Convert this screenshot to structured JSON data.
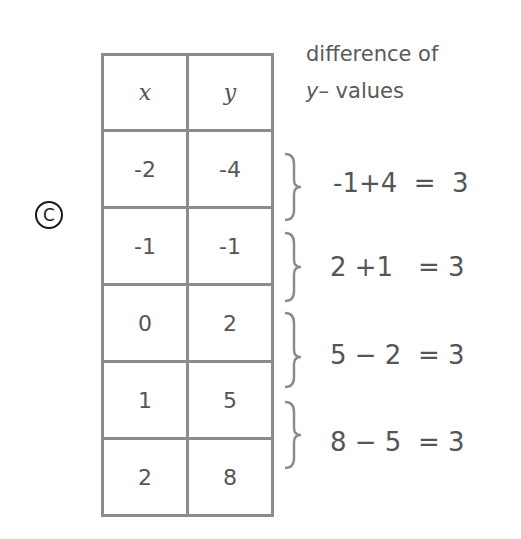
{
  "choice": {
    "label": "C",
    "symbol": "©"
  },
  "table": {
    "headers": {
      "x": "x",
      "y": "y"
    },
    "rows": [
      {
        "x": "-2",
        "y": "-4"
      },
      {
        "x": "-1",
        "y": "-1"
      },
      {
        "x": "0",
        "y": "2"
      },
      {
        "x": "1",
        "y": "5"
      },
      {
        "x": "2",
        "y": "8"
      }
    ]
  },
  "annotation": {
    "line1": "difference of",
    "line2_var": "y",
    "line2_rest": "– values"
  },
  "differences": [
    {
      "expression": "-1 + 4",
      "result": "3",
      "display": "-1+4  =  3"
    },
    {
      "expression": "2 + 1",
      "result": "3",
      "display": "2 +1   = 3"
    },
    {
      "expression": "5 − 2",
      "result": "3",
      "display": "5 − 2  = 3"
    },
    {
      "expression": "8 − 5",
      "result": "3",
      "display": "8 − 5  = 3"
    }
  ],
  "colors": {
    "lines": "#8c8c8c",
    "text": "#555555",
    "mark": "#1a1a1a"
  }
}
